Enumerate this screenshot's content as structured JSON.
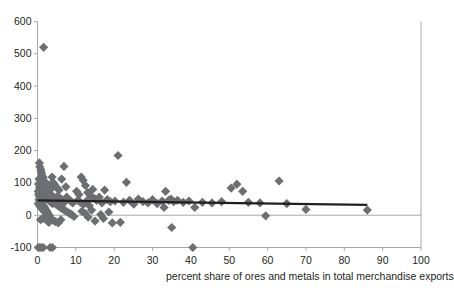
{
  "chart_data": {
    "type": "scatter",
    "title": "",
    "xlabel": "percent share of ores and metals in total merchandise exports",
    "ylabel": "",
    "xlim": [
      0,
      100
    ],
    "ylim": [
      -100,
      600
    ],
    "xticks": [
      0,
      10,
      20,
      30,
      40,
      50,
      60,
      70,
      80,
      90,
      100
    ],
    "yticks": [
      -100,
      0,
      100,
      200,
      300,
      400,
      500,
      600
    ],
    "grid": false,
    "legend": null,
    "marker": {
      "shape": "diamond",
      "color": "#6d6e71",
      "size": 4.6
    },
    "series": [
      {
        "name": "countries",
        "points": [
          [
            1.6,
            520
          ],
          [
            0.5,
            162
          ],
          [
            0.6,
            150
          ],
          [
            0.9,
            141
          ],
          [
            1.0,
            133
          ],
          [
            1.1,
            126
          ],
          [
            1.3,
            120
          ],
          [
            1.5,
            116
          ],
          [
            0.4,
            112
          ],
          [
            0.7,
            108
          ],
          [
            1.8,
            105
          ],
          [
            2.0,
            100
          ],
          [
            2.3,
            98
          ],
          [
            0.3,
            96
          ],
          [
            0.9,
            94
          ],
          [
            1.2,
            92
          ],
          [
            2.6,
            90
          ],
          [
            3.0,
            88
          ],
          [
            0.5,
            86
          ],
          [
            1.6,
            84
          ],
          [
            2.1,
            82
          ],
          [
            3.4,
            80
          ],
          [
            4.0,
            102
          ],
          [
            4.4,
            96
          ],
          [
            5.0,
            86
          ],
          [
            5.6,
            78
          ],
          [
            6.3,
            112
          ],
          [
            6.9,
            151
          ],
          [
            7.4,
            88
          ],
          [
            3.8,
            118
          ],
          [
            0.2,
            74
          ],
          [
            0.4,
            72
          ],
          [
            0.6,
            70
          ],
          [
            0.8,
            68
          ],
          [
            1.0,
            66
          ],
          [
            1.2,
            64
          ],
          [
            1.4,
            62
          ],
          [
            1.6,
            60
          ],
          [
            1.8,
            58
          ],
          [
            2.0,
            56
          ],
          [
            2.2,
            54
          ],
          [
            2.4,
            52
          ],
          [
            2.6,
            50
          ],
          [
            2.8,
            48
          ],
          [
            3.0,
            46
          ],
          [
            3.2,
            44
          ],
          [
            3.4,
            42
          ],
          [
            3.6,
            40
          ],
          [
            3.8,
            38
          ],
          [
            4.0,
            36
          ],
          [
            0.3,
            64
          ],
          [
            0.5,
            58
          ],
          [
            0.7,
            52
          ],
          [
            0.9,
            46
          ],
          [
            1.1,
            40
          ],
          [
            1.3,
            34
          ],
          [
            1.5,
            30
          ],
          [
            1.7,
            26
          ],
          [
            1.9,
            22
          ],
          [
            2.1,
            18
          ],
          [
            2.3,
            14
          ],
          [
            2.5,
            10
          ],
          [
            2.7,
            6
          ],
          [
            2.9,
            2
          ],
          [
            3.1,
            -2
          ],
          [
            0.4,
            48
          ],
          [
            0.6,
            44
          ],
          [
            0.8,
            38
          ],
          [
            1.0,
            32
          ],
          [
            1.2,
            28
          ],
          [
            1.4,
            24
          ],
          [
            1.6,
            20
          ],
          [
            1.8,
            16
          ],
          [
            2.0,
            12
          ],
          [
            2.2,
            8
          ],
          [
            0.2,
            36
          ],
          [
            0.5,
            30
          ],
          [
            0.9,
            24
          ],
          [
            1.3,
            18
          ],
          [
            1.7,
            12
          ],
          [
            2.4,
            60
          ],
          [
            2.8,
            66
          ],
          [
            3.3,
            56
          ],
          [
            3.7,
            62
          ],
          [
            4.2,
            54
          ],
          [
            4.6,
            48
          ],
          [
            5.1,
            58
          ],
          [
            5.5,
            44
          ],
          [
            6.0,
            52
          ],
          [
            6.5,
            46
          ],
          [
            7.0,
            40
          ],
          [
            7.6,
            56
          ],
          [
            8.1,
            50
          ],
          [
            8.6,
            44
          ],
          [
            9.2,
            38
          ],
          [
            4.8,
            34
          ],
          [
            5.3,
            30
          ],
          [
            5.8,
            26
          ],
          [
            6.2,
            22
          ],
          [
            6.8,
            18
          ],
          [
            7.2,
            14
          ],
          [
            7.8,
            10
          ],
          [
            8.3,
            6
          ],
          [
            8.9,
            2
          ],
          [
            9.5,
            -4
          ],
          [
            3.5,
            -12
          ],
          [
            4.1,
            -16
          ],
          [
            4.7,
            -20
          ],
          [
            5.4,
            -24
          ],
          [
            6.1,
            -14
          ],
          [
            2.6,
            -18
          ],
          [
            3.0,
            -22
          ],
          [
            2.2,
            -8
          ],
          [
            1.4,
            -10
          ],
          [
            0.8,
            -14
          ],
          [
            10.2,
            74
          ],
          [
            10.8,
            64
          ],
          [
            11.4,
            118
          ],
          [
            11.9,
            108
          ],
          [
            12.5,
            92
          ],
          [
            13.1,
            70
          ],
          [
            13.8,
            60
          ],
          [
            14.4,
            80
          ],
          [
            10.5,
            46
          ],
          [
            11.2,
            40
          ],
          [
            12.0,
            34
          ],
          [
            12.8,
            44
          ],
          [
            13.5,
            30
          ],
          [
            14.8,
            52
          ],
          [
            15.4,
            46
          ],
          [
            16.1,
            56
          ],
          [
            16.8,
            38
          ],
          [
            17.5,
            78
          ],
          [
            18.2,
            48
          ],
          [
            19.0,
            42
          ],
          [
            11.6,
            12
          ],
          [
            12.4,
            6
          ],
          [
            13.2,
            -6
          ],
          [
            14.1,
            16
          ],
          [
            15.0,
            -18
          ],
          [
            16.5,
            2
          ],
          [
            17.2,
            -10
          ],
          [
            18.6,
            10
          ],
          [
            19.5,
            -24
          ],
          [
            20.2,
            44
          ],
          [
            21.0,
            185
          ],
          [
            21.6,
            -22
          ],
          [
            22.4,
            40
          ],
          [
            23.2,
            102
          ],
          [
            24.0,
            46
          ],
          [
            25.1,
            34
          ],
          [
            26.3,
            50
          ],
          [
            27.5,
            42
          ],
          [
            28.8,
            38
          ],
          [
            30.0,
            48
          ],
          [
            31.2,
            36
          ],
          [
            32.5,
            44
          ],
          [
            33.4,
            74
          ],
          [
            34.2,
            46
          ],
          [
            34.8,
            50
          ],
          [
            35.5,
            42
          ],
          [
            35.0,
            -38
          ],
          [
            33.0,
            24
          ],
          [
            36.5,
            46
          ],
          [
            38.0,
            40
          ],
          [
            39.5,
            44
          ],
          [
            40.5,
            -100
          ],
          [
            41.0,
            24
          ],
          [
            43.0,
            40
          ],
          [
            45.5,
            38
          ],
          [
            48.0,
            42
          ],
          [
            50.5,
            84
          ],
          [
            52.0,
            96
          ],
          [
            53.5,
            74
          ],
          [
            55.0,
            40
          ],
          [
            58.0,
            38
          ],
          [
            59.5,
            -2
          ],
          [
            63.0,
            106
          ],
          [
            65.0,
            36
          ],
          [
            70.0,
            18
          ],
          [
            86.0,
            16
          ],
          [
            0.2,
            -100
          ],
          [
            0.6,
            -100
          ],
          [
            1.0,
            -100
          ],
          [
            1.5,
            -100
          ],
          [
            3.3,
            -100
          ],
          [
            3.9,
            -100
          ]
        ]
      }
    ],
    "trendline": {
      "x_start": 0.0,
      "y_start": 46,
      "x_end": 86.0,
      "y_end": 32,
      "color": "#231f20",
      "width": 2.2
    },
    "zero_line": {
      "y": 0,
      "color": "#a7a9ac"
    }
  },
  "axes": {
    "x_tick_labels": [
      "0",
      "10",
      "20",
      "30",
      "40",
      "50",
      "60",
      "70",
      "80",
      "90",
      "100"
    ],
    "y_tick_labels": [
      "-100",
      "0",
      "100",
      "200",
      "300",
      "400",
      "500",
      "600"
    ],
    "x_title": "percent share of ores and metals in total merchandise exports"
  },
  "colors": {
    "marker": "#6d6e71",
    "axis": "#a7a9ac",
    "text": "#231f20",
    "trend": "#231f20",
    "background": "#ffffff"
  }
}
